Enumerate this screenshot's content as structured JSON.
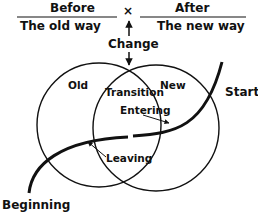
{
  "diagram": {
    "header": {
      "before_label": "Before",
      "before_sub": "The old way",
      "separator_symbol": "×",
      "after_label": "After",
      "after_sub": "The new way"
    },
    "change_label": "Change",
    "circles": {
      "left_label": "Old",
      "overlap_label": "Transition",
      "right_label": "New"
    },
    "arrows": {
      "entering_label": "Entering",
      "leaving_label": "Leaving"
    },
    "curve": {
      "start_label": "Start",
      "beginning_label": "Beginning"
    },
    "colors": {
      "ink": "#111111",
      "background": "#ffffff"
    }
  }
}
